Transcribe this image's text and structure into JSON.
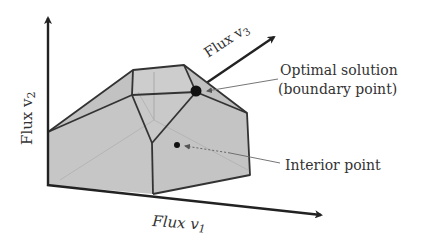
{
  "diagram": {
    "type": "flux-polytope",
    "axes": {
      "v1": {
        "label": "Flux v",
        "subscript": "1"
      },
      "v2": {
        "label": "Flux v",
        "subscript": "2"
      },
      "v3": {
        "label": "Flux v",
        "subscript": "3"
      }
    },
    "annotations": {
      "optimal_line1": "Optimal solution",
      "optimal_line2": "(boundary point)",
      "interior": "Interior point"
    },
    "colors": {
      "polytope_fill": "#c8c8c8",
      "edge": "#333333",
      "axis": "#222222",
      "hidden_edge": "#a8a8a8",
      "text": "#333333",
      "leader": "#666666"
    }
  }
}
